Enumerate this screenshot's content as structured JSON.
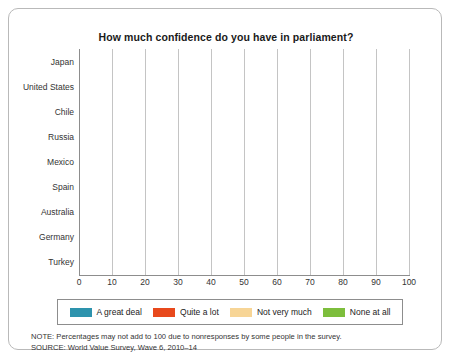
{
  "card": {
    "note_text": "NOTE: Percentages may not add to 100 due to nonresponses by some people in the survey.",
    "source_text": "SOURCE: World Value Survey, Wave 6, 2010–14"
  },
  "colors": {
    "great_deal": "#2d93ad",
    "quite_a_lot": "#e8491c",
    "not_very_much": "#f7d596",
    "none_at_all": "#7dbe3c",
    "grid": "#c4c4c4",
    "axis": "#8d8d8d",
    "card_border": "#b9b9b9",
    "text": "#333333"
  },
  "chart_data": {
    "type": "bar",
    "orientation": "horizontal",
    "stacked": true,
    "title": "How much confidence do you have in parliament?",
    "xlabel": "",
    "ylabel": "",
    "xlim": [
      0,
      100
    ],
    "xticks": [
      0,
      10,
      20,
      30,
      40,
      50,
      60,
      70,
      80,
      90,
      100
    ],
    "grid": true,
    "legend_position": "bottom",
    "categories": [
      "Japan",
      "United States",
      "Chile",
      "Russia",
      "Mexico",
      "Spain",
      "Australia",
      "Germany",
      "Turkey"
    ],
    "series": [
      {
        "name": "A great deal",
        "color": "#2d93ad",
        "values": [
          2,
          3,
          3,
          5,
          4,
          4,
          6,
          7,
          17
        ]
      },
      {
        "name": "Quite a lot",
        "color": "#e8491c",
        "values": [
          18,
          17,
          22,
          26,
          21,
          29,
          22,
          36,
          37
        ]
      },
      {
        "name": "Not very much",
        "color": "#f7d596",
        "values": [
          51,
          59,
          45,
          36,
          36,
          47,
          53,
          45,
          28
        ]
      },
      {
        "name": "None at all",
        "color": "#7dbe3c",
        "values": [
          17,
          18,
          28,
          23,
          39,
          18,
          16,
          8,
          14
        ]
      }
    ],
    "cumulative_ends": [
      [
        2,
        20,
        71,
        88
      ],
      [
        3,
        20,
        79,
        97
      ],
      [
        3,
        25,
        70,
        98
      ],
      [
        5,
        31,
        67,
        90
      ],
      [
        4,
        25,
        61,
        100
      ],
      [
        4,
        33,
        80,
        98
      ],
      [
        6,
        28,
        81,
        97
      ],
      [
        7,
        43,
        88,
        96
      ],
      [
        17,
        54,
        82,
        96
      ]
    ],
    "notes": [
      "NOTE: Percentages may not add to 100 due to nonresponses by some people in the survey.",
      "SOURCE: World Value Survey, Wave 6, 2010–14"
    ]
  }
}
